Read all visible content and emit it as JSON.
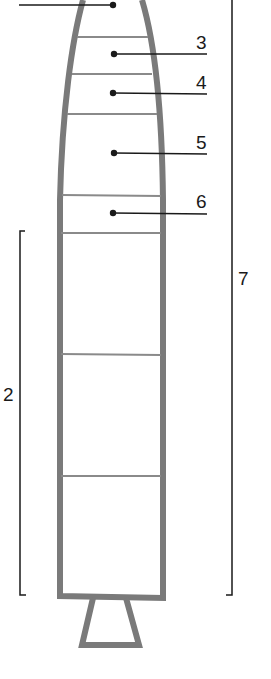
{
  "diagram": {
    "type": "rocket-cutaway",
    "colors": {
      "outline": "#7a7a7a",
      "divider": "#8a8a8a",
      "leader": "#1a1a1a",
      "background": "#ffffff"
    },
    "callouts": [
      {
        "id": "1",
        "label": "",
        "side": "left"
      },
      {
        "id": "3",
        "label": "3",
        "side": "right"
      },
      {
        "id": "4",
        "label": "4",
        "side": "right"
      },
      {
        "id": "5",
        "label": "5",
        "side": "right"
      },
      {
        "id": "6",
        "label": "6",
        "side": "right"
      }
    ],
    "brackets": [
      {
        "id": "2",
        "label": "2",
        "side": "left"
      },
      {
        "id": "7",
        "label": "7",
        "side": "right"
      }
    ]
  }
}
